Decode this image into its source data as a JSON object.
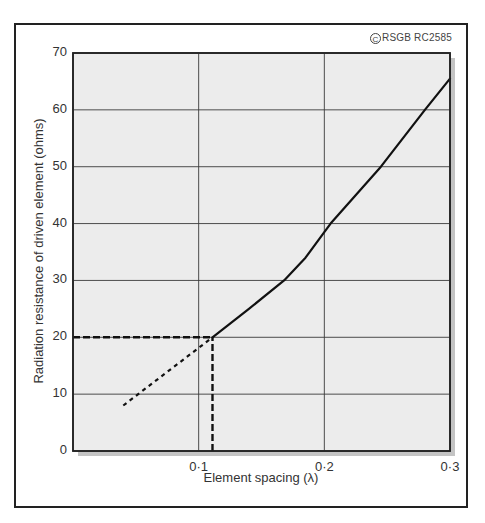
{
  "chart_data": {
    "type": "line",
    "title": "",
    "copyright": "RSGB RC2585",
    "copyright_symbol": "C",
    "xlabel": "Element spacing (λ)",
    "ylabel": "Radiation resistance of driven element (ohms)",
    "xlim": [
      0,
      0.3
    ],
    "ylim": [
      0,
      70
    ],
    "x_ticks": [
      "0·1",
      "0·2",
      "0·3"
    ],
    "x_tick_values": [
      0.1,
      0.2,
      0.3
    ],
    "y_ticks": [
      "0",
      "10",
      "20",
      "30",
      "40",
      "50",
      "60",
      "70"
    ],
    "y_tick_values": [
      0,
      10,
      20,
      30,
      40,
      50,
      60,
      70
    ],
    "grid": true,
    "legend": null,
    "series": [
      {
        "name": "Radiation resistance (measured)",
        "style": "solid",
        "x": [
          0.111,
          0.14,
          0.168,
          0.185,
          0.2,
          0.205,
          0.245,
          0.28,
          0.3
        ],
        "y": [
          20,
          25,
          30,
          34,
          38.5,
          40,
          50,
          60,
          65.5
        ]
      },
      {
        "name": "Extrapolation",
        "style": "dotted",
        "x": [
          0.04,
          0.111
        ],
        "y": [
          8,
          20
        ]
      }
    ],
    "annotations": [
      {
        "type": "dashed-hline",
        "y": 20,
        "x_from": 0,
        "x_to": 0.111
      },
      {
        "type": "dashed-vline",
        "x": 0.111,
        "y_from": 0,
        "y_to": 20
      }
    ],
    "colors": {
      "plot_background": "#ececec",
      "line": "#111111",
      "grid": "#3a3a3a",
      "shadow": "#c4c4c4"
    }
  }
}
